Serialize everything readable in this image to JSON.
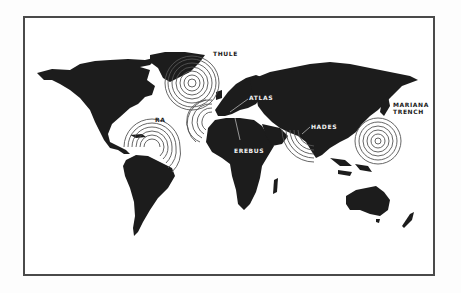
{
  "map": {
    "title": "",
    "colors": {
      "land": "#1c1c1c",
      "ocean": "#ffffff",
      "rings": "#555555",
      "frame": "#4a4a4a"
    },
    "locations": [
      {
        "id": "thule",
        "label": "THULE",
        "label_style": "dark",
        "ring_center": [
          192,
          83
        ],
        "rings": 7,
        "max_radius": 26
      },
      {
        "id": "atlas",
        "label": "ATLAS",
        "label_style": "light",
        "ring_center": [
          212,
          122
        ],
        "rings": 6,
        "max_radius": 22
      },
      {
        "id": "ra",
        "label": "RA",
        "label_style": "dark",
        "ring_center": [
          152,
          147
        ],
        "rings": 7,
        "max_radius": 26
      },
      {
        "id": "erebus",
        "label": "EREBUS",
        "label_style": "light",
        "ring_center": null,
        "rings": 0,
        "max_radius": 0
      },
      {
        "id": "hades",
        "label": "HADES",
        "label_style": "light",
        "ring_center": [
          314,
          130
        ],
        "rings": 6,
        "max_radius": 34
      },
      {
        "id": "mariana",
        "label_lines": [
          "MARIANA",
          "TRENCH"
        ],
        "label_style": "dark",
        "ring_center": [
          378,
          141
        ],
        "rings": 7,
        "max_radius": 24
      }
    ]
  }
}
